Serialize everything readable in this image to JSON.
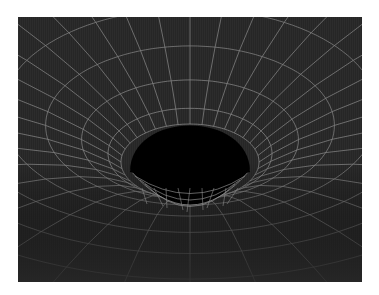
{
  "image": {
    "subject": "Gravity well / black hole wireframe illustration",
    "alt": "A dark wireframe grid curving down into a black circular hole, depicting warped spacetime around a black hole"
  },
  "colors": {
    "page_background": "#ffffff",
    "panel_background": "#262626",
    "grid_line": "#8a8a8a",
    "grid_line_faint": "#4a4a4a",
    "hole": "#000000"
  },
  "scene": {
    "hole_center": [
      172,
      145
    ],
    "hole_radius_x": 60,
    "hole_radius_y": 40,
    "radial_lines": 36,
    "rings": 10
  }
}
